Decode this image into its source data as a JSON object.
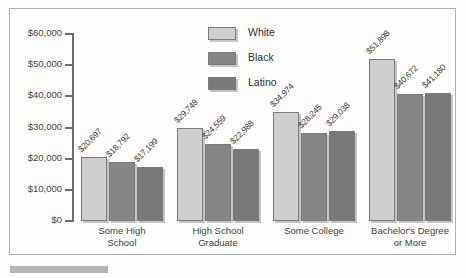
{
  "chart_data": {
    "type": "bar",
    "title": "",
    "subtitle": "",
    "xlabel": "",
    "ylabel": "",
    "ylim": [
      0,
      60000
    ],
    "ytick_labels": [
      "$60,000",
      "$50,000",
      "$40,000",
      "$30,000",
      "$20,000",
      "$10,000",
      "$0"
    ],
    "ytick_values": [
      60000,
      50000,
      40000,
      30000,
      20000,
      10000,
      0
    ],
    "grid": false,
    "legend_position": "top-center",
    "categories": [
      "Some High\nSchool",
      "High School\nGraduate",
      "Some College",
      "Bachelor's Degree\nor More"
    ],
    "series": [
      {
        "name": "White",
        "color": "#cfcfcf",
        "values": [
          20697,
          29748,
          34974,
          51898
        ],
        "labels": [
          "$20,697",
          "$29,748",
          "$34,974",
          "$51,898"
        ]
      },
      {
        "name": "Black",
        "color": "#858585",
        "values": [
          18792,
          24559,
          28245,
          40672
        ],
        "labels": [
          "$18,792",
          "$24,559",
          "$28,245",
          "$40,672"
        ]
      },
      {
        "name": "Latino",
        "color": "#797979",
        "values": [
          17199,
          22988,
          29038,
          41180
        ],
        "labels": [
          "$17,199",
          "$22,988",
          "$29,038",
          "$41,180"
        ]
      }
    ]
  },
  "legend": {
    "items": [
      {
        "label": "White"
      },
      {
        "label": "Black"
      },
      {
        "label": "Latino"
      }
    ]
  }
}
